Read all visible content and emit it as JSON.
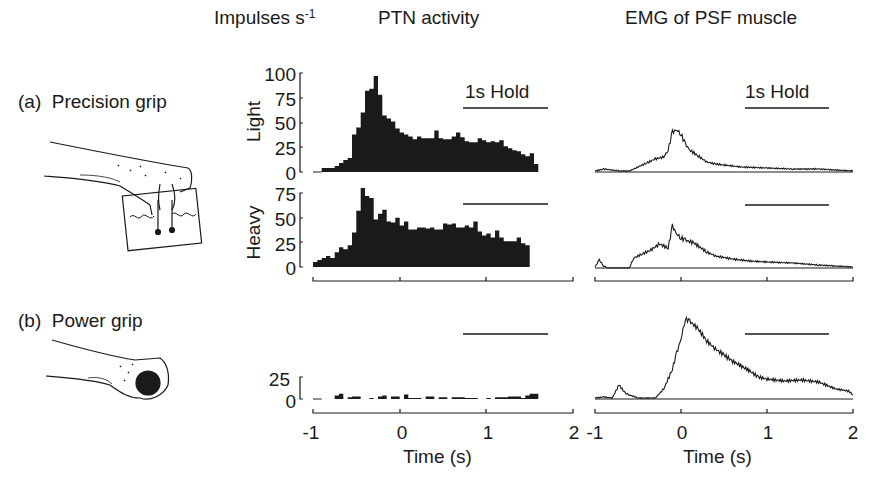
{
  "header": {
    "units_label": "Impulses s",
    "units_exp": "-1",
    "ptn_title": "PTN activity",
    "emg_title": "EMG of PSF muscle"
  },
  "rows": {
    "a_label": "(a)  Precision grip",
    "b_label": "(b)  Power grip",
    "light_label": "Light",
    "heavy_label": "Heavy"
  },
  "hold_label": "1s Hold",
  "xaxis": {
    "ticks": [
      "-1",
      "0",
      "1",
      "2"
    ],
    "label": "Time (s)"
  },
  "yticks": {
    "light": [
      "100",
      "75",
      "50",
      "25",
      "0"
    ],
    "heavy": [
      "75",
      "50",
      "25",
      "0"
    ],
    "power": [
      "25",
      "0"
    ]
  },
  "colors": {
    "ink": "#1a1a1a",
    "background": "#ffffff"
  },
  "chart_data": [
    {
      "type": "bar",
      "title": "PTN activity — Precision grip, Light",
      "ylabel": "Impulses s-1",
      "xlabel": "Time (s)",
      "xlim": [
        -1,
        2
      ],
      "ylim": [
        0,
        100
      ],
      "bin_width_s": 0.05,
      "x_start": -0.9,
      "values": [
        4,
        4,
        4,
        6,
        9,
        12,
        14,
        38,
        45,
        60,
        82,
        84,
        97,
        78,
        57,
        54,
        51,
        44,
        40,
        38,
        36,
        33,
        36,
        34,
        34,
        34,
        42,
        34,
        33,
        33,
        36,
        40,
        35,
        31,
        30,
        30,
        34,
        32,
        30,
        31,
        30,
        32,
        26,
        24,
        22,
        21,
        18,
        16,
        19,
        8
      ]
    },
    {
      "type": "bar",
      "title": "PTN activity — Precision grip, Heavy",
      "ylabel": "Impulses s-1",
      "xlabel": "Time (s)",
      "xlim": [
        -1,
        2
      ],
      "ylim": [
        0,
        75
      ],
      "bin_width_s": 0.05,
      "x_start": -1.0,
      "values": [
        5,
        7,
        9,
        11,
        9,
        15,
        20,
        18,
        22,
        35,
        57,
        80,
        72,
        70,
        48,
        54,
        58,
        46,
        45,
        50,
        42,
        46,
        38,
        38,
        40,
        40,
        39,
        40,
        38,
        38,
        44,
        43,
        44,
        40,
        40,
        42,
        40,
        46,
        36,
        32,
        34,
        30,
        37,
        30,
        26,
        26,
        26,
        30,
        24,
        22
      ]
    },
    {
      "type": "bar",
      "title": "PTN activity — Power grip",
      "ylabel": "Impulses s-1",
      "xlabel": "Time (s)",
      "xlim": [
        -1,
        2
      ],
      "ylim": [
        0,
        25
      ],
      "bin_width_s": 0.05,
      "x_start": -0.9,
      "values": [
        0,
        0,
        0,
        4,
        6,
        0,
        2,
        3,
        3,
        0,
        0,
        1,
        0,
        3,
        4,
        0,
        3,
        3,
        0,
        5,
        1,
        1,
        1,
        0,
        3,
        3,
        0,
        2,
        2,
        0,
        2,
        2,
        2,
        1,
        1,
        1,
        0,
        0,
        1,
        0,
        2,
        2,
        2,
        3,
        3,
        3,
        1,
        4,
        6,
        6
      ]
    },
    {
      "type": "line",
      "title": "EMG of PSF muscle — Precision grip, Light",
      "xlabel": "Time (s)",
      "xlim": [
        -1,
        2
      ],
      "units": "relative",
      "x": [
        -1.0,
        -0.9,
        -0.8,
        -0.7,
        -0.6,
        -0.5,
        -0.4,
        -0.3,
        -0.2,
        -0.15,
        -0.1,
        -0.05,
        0.0,
        0.05,
        0.1,
        0.2,
        0.3,
        0.4,
        0.5,
        0.7,
        1.0,
        1.3,
        1.6,
        1.8,
        2.0
      ],
      "values": [
        1,
        3,
        2,
        1,
        1,
        5,
        9,
        13,
        15,
        22,
        40,
        42,
        38,
        28,
        22,
        16,
        10,
        8,
        7,
        5,
        4,
        3,
        3,
        2,
        1
      ]
    },
    {
      "type": "line",
      "title": "EMG of PSF muscle — Precision grip, Heavy",
      "xlabel": "Time (s)",
      "xlim": [
        -1,
        2
      ],
      "units": "relative",
      "x": [
        -1.0,
        -0.95,
        -0.9,
        -0.85,
        -0.6,
        -0.55,
        -0.45,
        -0.35,
        -0.25,
        -0.15,
        -0.1,
        -0.05,
        0.0,
        0.05,
        0.15,
        0.3,
        0.4,
        0.6,
        0.8,
        1.0,
        1.3,
        1.6,
        1.8,
        2.0
      ],
      "values": [
        1,
        8,
        2,
        0,
        0,
        10,
        14,
        18,
        24,
        20,
        42,
        34,
        30,
        28,
        25,
        16,
        12,
        9,
        7,
        6,
        5,
        3,
        2,
        1
      ]
    },
    {
      "type": "line",
      "title": "EMG of PSF muscle — Power grip",
      "xlabel": "Time (s)",
      "xlim": [
        -1,
        2
      ],
      "units": "relative",
      "x": [
        -1.0,
        -0.9,
        -0.8,
        -0.72,
        -0.65,
        -0.6,
        -0.5,
        -0.3,
        -0.2,
        -0.1,
        -0.05,
        0.0,
        0.05,
        0.1,
        0.2,
        0.3,
        0.4,
        0.5,
        0.6,
        0.8,
        0.9,
        1.0,
        1.2,
        1.4,
        1.6,
        1.8,
        1.95,
        2.0
      ],
      "values": [
        1,
        2,
        1,
        14,
        6,
        4,
        1,
        1,
        10,
        30,
        46,
        60,
        80,
        78,
        70,
        58,
        50,
        44,
        38,
        28,
        22,
        20,
        18,
        19,
        17,
        10,
        8,
        4
      ]
    }
  ]
}
